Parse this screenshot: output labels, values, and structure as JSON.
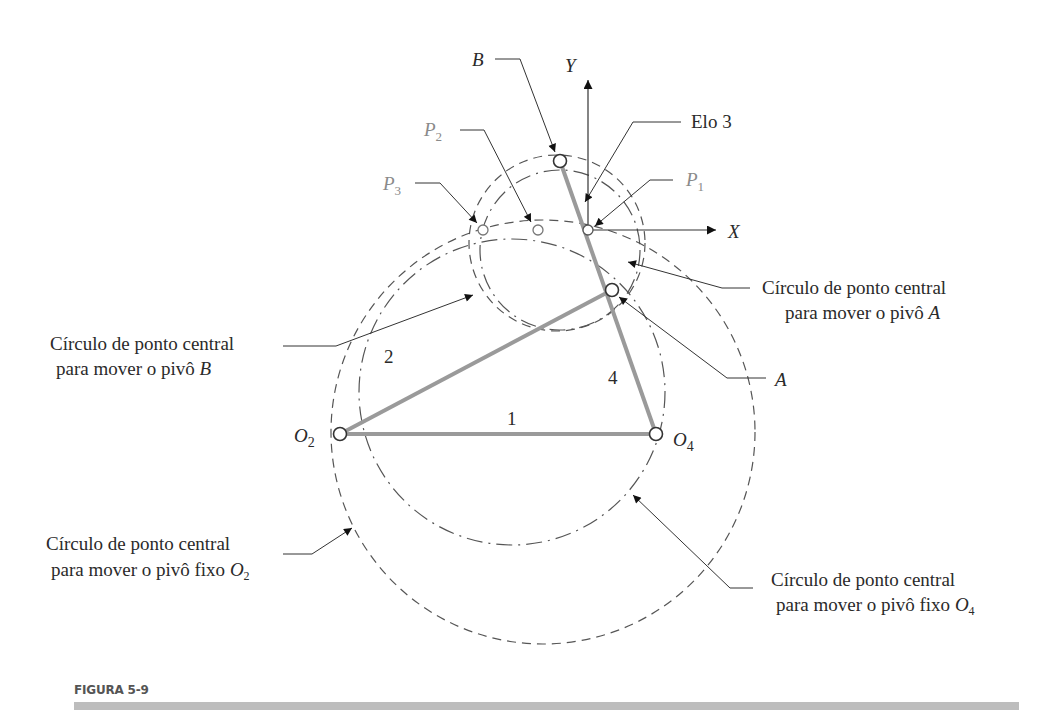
{
  "figure": {
    "caption": "FIGURA 5-9",
    "colors": {
      "link": "#9a9a9a",
      "text": "#2a2a2a",
      "precision_points": "#8a8a8a",
      "caption_bar": "#bdbdbd"
    }
  },
  "points": {
    "B": "B",
    "Y": "Y",
    "X": "X",
    "elo3": "Elo 3",
    "P1": "P",
    "P1_sub": "1",
    "P2": "P",
    "P2_sub": "2",
    "P3": "P",
    "P3_sub": "3",
    "A": "A",
    "O2": "O",
    "O2_sub": "2",
    "O4": "O",
    "O4_sub": "4"
  },
  "links": {
    "l1": "1",
    "l2": "2",
    "l4": "4"
  },
  "callouts": {
    "circle_A": {
      "line1": "Círculo de ponto central",
      "line2": "para mover o pivô ",
      "var": "A"
    },
    "circle_B": {
      "line1": "Círculo de ponto central",
      "line2": "para mover o pivô ",
      "var": "B"
    },
    "circle_O2": {
      "line1": "Círculo de ponto central",
      "line2": "para mover o pivô fixo ",
      "var": "O",
      "sub": "2"
    },
    "circle_O4": {
      "line1": "Círculo de ponto central",
      "line2": "para mover o pivô fixo ",
      "var": "O",
      "sub": "4"
    }
  }
}
